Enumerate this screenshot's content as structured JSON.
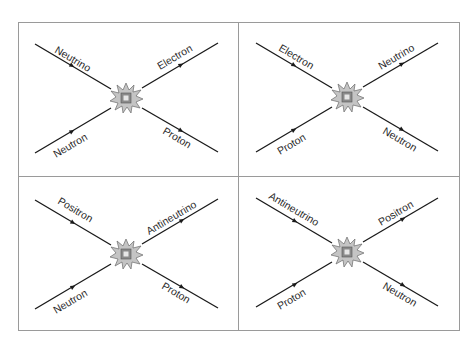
{
  "figure": {
    "colors": {
      "line": "#1a1a1a",
      "frame": "#9a9a9a",
      "burst_fill": "#c4c4c4",
      "burst_core": "#8a8a8a",
      "background": "#ffffff"
    }
  },
  "panels": [
    {
      "position": "top-left",
      "incoming_upper": "Neutrino",
      "incoming_lower": "Neutron",
      "outgoing_upper": "Electron",
      "outgoing_lower": "Proton"
    },
    {
      "position": "top-right",
      "incoming_upper": "Electron",
      "incoming_lower": "Proton",
      "outgoing_upper": "Neutrino",
      "outgoing_lower": "Neutron"
    },
    {
      "position": "bottom-left",
      "incoming_upper": "Positron",
      "incoming_lower": "Neutron",
      "outgoing_upper": "Antineutrino",
      "outgoing_lower": "Proton"
    },
    {
      "position": "bottom-right",
      "incoming_upper": "Antineutrino",
      "incoming_lower": "Proton",
      "outgoing_upper": "Positron",
      "outgoing_lower": "Neutron"
    }
  ]
}
